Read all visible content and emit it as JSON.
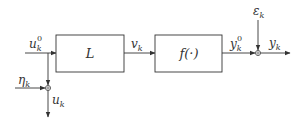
{
  "diagram": {
    "type": "block-diagram",
    "blocks": [
      {
        "id": "linear",
        "label": "L"
      },
      {
        "id": "nonlinear",
        "label": "f(·)"
      }
    ],
    "signals": {
      "input": {
        "base": "u",
        "sub": "k",
        "sup": "0"
      },
      "input_noise": {
        "base": "η",
        "sub": "k"
      },
      "measured_input": {
        "base": "u",
        "sub": "k"
      },
      "intermediate": {
        "base": "v",
        "sub": "k"
      },
      "noise_free_output": {
        "base": "y",
        "sub": "k",
        "sup": "0"
      },
      "output_noise": {
        "base": "ε",
        "sub": "k"
      },
      "measured_output": {
        "base": "y",
        "sub": "k"
      }
    },
    "colors": {
      "line": "#333333",
      "background": "#ffffff"
    }
  }
}
